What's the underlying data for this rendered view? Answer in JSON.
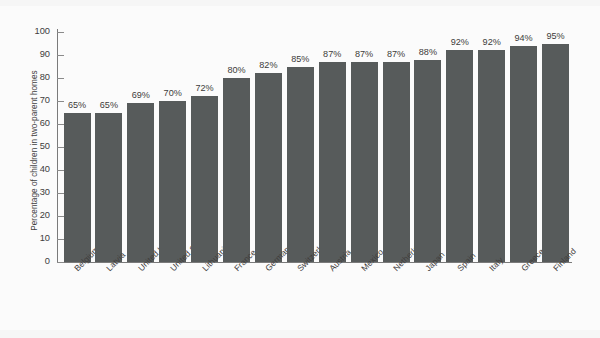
{
  "chart_data": {
    "type": "bar",
    "title": "",
    "xlabel": "",
    "ylabel": "Percentage of children in two-parent homes",
    "ylim": [
      0,
      100
    ],
    "ytick_step": 10,
    "yticks": [
      0,
      10,
      20,
      30,
      40,
      50,
      60,
      70,
      80,
      90,
      100
    ],
    "grid": false,
    "legend": false,
    "orientation": "vertical",
    "bar_color": "#575b5b",
    "background_color": "#fbfbfb",
    "value_label_suffix": "%",
    "categories": [
      "Belgium",
      "Latvia",
      "United Kingdom",
      "United States",
      "Lithuania",
      "France",
      "Germany",
      "Switzerland",
      "Austria",
      "Mexico",
      "Netherlands",
      "Japan",
      "Spain",
      "Italy",
      "Greece",
      "Finland"
    ],
    "values": [
      65,
      65,
      69,
      70,
      72,
      80,
      82,
      85,
      87,
      87,
      87,
      88,
      92,
      92,
      94,
      95
    ],
    "value_labels": [
      "65%",
      "65%",
      "69%",
      "70%",
      "72%",
      "80%",
      "82%",
      "85%",
      "87%",
      "87%",
      "87%",
      "88%",
      "92%",
      "92%",
      "94%",
      "95%"
    ]
  },
  "axis": {
    "y_title": "Percentage of children in two-parent homes",
    "y_tick_labels": [
      "100",
      "90",
      "80",
      "70",
      "60",
      "50",
      "40",
      "30",
      "20",
      "10",
      "0"
    ]
  }
}
